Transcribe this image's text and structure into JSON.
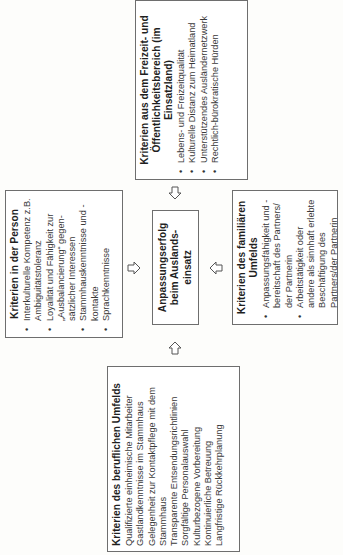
{
  "center": {
    "line1": "Anpassungserfolg",
    "line2": "beim Auslands-",
    "line3": "einsatz"
  },
  "person": {
    "title": "Kriterien in der Person",
    "items": [
      "Interkulturelle Kompetenz z.B. Ambiguitätstoleranz",
      "Loyalität und Fähigkeit zur „Ausbalancierung“ gegen-sätzlicher Interessen",
      "Stammhauskenntnisse und -kontakte",
      "Sprachkenntnisse"
    ]
  },
  "freizeit": {
    "title_line1": "Kriterien aus dem Freizeit- und",
    "title_line2": "Öffentlichkeitsbereich (im Einsatzland)",
    "items": [
      "Lebens- und Freizeitqualität",
      "Kulturelle Distanz zum Heimatland",
      "Unterstützendes Ausländernetzwerk",
      "Rechtlich-bürokratische Hürden"
    ]
  },
  "beruflich": {
    "title": "Kriterien des beruflichen Umfelds",
    "items": [
      "Qualifizierte einheimische Mitarbeiter",
      "Gastlandkenntnisse im Stammhaus",
      "Gelegenheit zur Kontaktpflege mit dem Stammhaus",
      "Transparente Entsendungsrichtlinien",
      "Sorgfältige Personalauswahl",
      "Kulturbezogene Vorbereitung",
      "Kontinuierliche Betreuung",
      "Langfristige Rückkehrplanung"
    ]
  },
  "familiaer": {
    "title_line1": "Kriterien des familiären",
    "title_line2": "Umfelds",
    "items": [
      "Anpassungsfähigkeit und -bereitschaft des Partners/ der Partnerin",
      "Arbeitstätigkeit oder andere als sinnhaft erlebte Beschäftigung des Partners/der Partnerin"
    ]
  },
  "icons": {
    "arrow": "hollow-block-arrow"
  },
  "colors": {
    "border": "#6e6e6e",
    "text": "#2a2a2a",
    "background": "#ffffff"
  }
}
